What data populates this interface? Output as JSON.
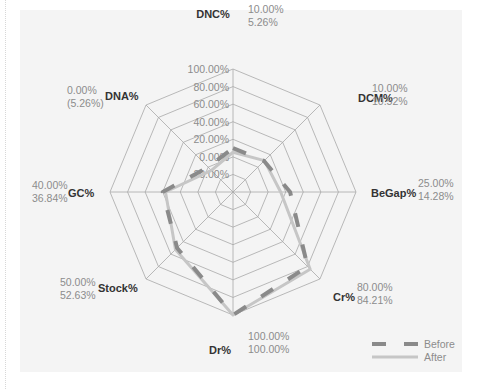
{
  "chart_data": {
    "type": "radar",
    "title": "",
    "axes": [
      "DNC%",
      "DCM%",
      "BeGap%",
      "Cr%",
      "Dr%",
      "Stock%",
      "GC%",
      "DNA%"
    ],
    "series": [
      {
        "name": "Before",
        "values": [
          10.0,
          10.0,
          25.0,
          80.0,
          100.0,
          50.0,
          40.0,
          0.0
        ],
        "style": "dashed",
        "color": "#8a8a8a"
      },
      {
        "name": "After",
        "values": [
          5.26,
          10.52,
          14.28,
          84.21,
          100.0,
          52.63,
          36.84,
          -5.26
        ],
        "style": "solid",
        "color": "#c6c6c6"
      }
    ],
    "value_labels": [
      {
        "axis": "DNC%",
        "before": "10.00%",
        "after": "5.26%"
      },
      {
        "axis": "DCM%",
        "before": "10.00%",
        "after": "10.52%"
      },
      {
        "axis": "BeGap%",
        "before": "25.00%",
        "after": "14.28%"
      },
      {
        "axis": "Cr%",
        "before": "80.00%",
        "after": "84.21%"
      },
      {
        "axis": "Dr%",
        "before": "100.00%",
        "after": "100.00%"
      },
      {
        "axis": "Stock%",
        "before": "50.00%",
        "after": "52.63%"
      },
      {
        "axis": "GC%",
        "before": "40.00%",
        "after": "36.84%"
      },
      {
        "axis": "DNA%",
        "before": "0.00%",
        "after": "(5.26%)"
      }
    ],
    "tick_labels": [
      "-20.00%",
      "0.00%",
      "20.00%",
      "40.00%",
      "60.00%",
      "80.00%",
      "100.00%"
    ],
    "range": [
      -40,
      100
    ],
    "grid": true,
    "legend_position": "bottom-right"
  },
  "legend": {
    "before": "Before",
    "after": "After"
  }
}
